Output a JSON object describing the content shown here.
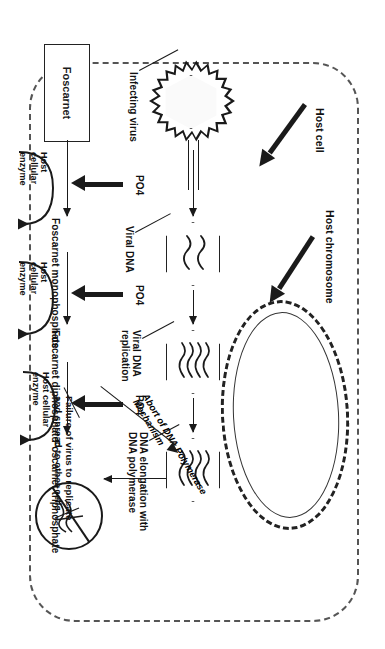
{
  "figure": {
    "type": "biomedical-pathway-diagram",
    "orientation": "rotated-90-degrees-clockwise",
    "ink_color": "#1a1a1a",
    "background_color": "#ffffff"
  },
  "labels": {
    "host_cell": "Host cell",
    "host_chromosome": "Host chromosome",
    "infecting_virus": "Infecting virus",
    "viral_dna": "Viral DNA",
    "viral_dna_replication": "Viral DNA\nreplication",
    "dna_elongation": "DNA elongation with\nDNA polymerase",
    "abort_mechanism": "Abort of\nDNA Polymerase\nMechanism",
    "failure": "Failure of virus to replicate\nand spread to other cells"
  },
  "drug_pathway": {
    "start_label": "Foscarnet",
    "steps": [
      {
        "product": "Foscarnet monophosphate",
        "addition": "PO4",
        "enzyme": "Host\ncellular\nenzyme"
      },
      {
        "product": "Foscarnet diphosphate",
        "addition": "PO4",
        "enzyme": "Host\ncellular\nenzyme"
      },
      {
        "product": "Foscarnet triphosphate",
        "addition": "PO4",
        "enzyme": "Host cellular\nenzyme"
      }
    ]
  },
  "virus_pathway": {
    "stages": [
      {
        "id": "virion",
        "label": "Infecting virus"
      },
      {
        "id": "viral-dna",
        "label": "Viral DNA"
      },
      {
        "id": "replication",
        "label": "Viral DNA replication"
      },
      {
        "id": "elongation",
        "label": "DNA elongation with DNA polymerase"
      },
      {
        "id": "blocked",
        "label": "Failure of virus to replicate and spread to other cells"
      }
    ]
  },
  "icons": {
    "virus": "virus-icon",
    "hexagon_capsid": "hexagon-capsid-icon",
    "no_entry": "no-entry-icon",
    "enzyme_loop": "curved-recycle-arrow-icon"
  }
}
